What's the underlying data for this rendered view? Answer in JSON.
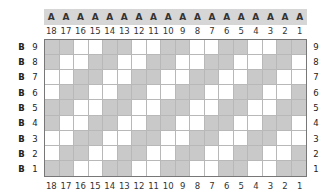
{
  "header": {
    "row_letter": "A",
    "letters": [
      "A",
      "A",
      "A",
      "A",
      "A",
      "A",
      "A",
      "A",
      "A",
      "A",
      "A",
      "A",
      "A",
      "A",
      "A",
      "A",
      "A",
      "A"
    ]
  },
  "columns": [
    "18",
    "17",
    "16",
    "15",
    "14",
    "13",
    "12",
    "11",
    "10",
    "9",
    "8",
    "7",
    "6",
    "5",
    "4",
    "3",
    "2",
    "1"
  ],
  "rows": [
    {
      "letter": "B",
      "number": "9"
    },
    {
      "letter": "B",
      "number": "8"
    },
    {
      "letter": "B",
      "number": "7"
    },
    {
      "letter": "B",
      "number": "6"
    },
    {
      "letter": "B",
      "number": "5"
    },
    {
      "letter": "B",
      "number": "4"
    },
    {
      "letter": "B",
      "number": "3"
    },
    {
      "letter": "B",
      "number": "2"
    },
    {
      "letter": "B",
      "number": "1"
    }
  ],
  "grid": {
    "shaded_color": "#c9c9c9",
    "unshaded_color": "#ffffff",
    "pattern": [
      [
        1,
        1,
        0,
        0,
        1,
        1,
        0,
        0,
        1,
        1,
        0,
        0,
        1,
        1,
        0,
        0,
        1,
        1
      ],
      [
        1,
        0,
        0,
        1,
        1,
        0,
        0,
        1,
        1,
        0,
        0,
        1,
        1,
        0,
        0,
        1,
        1,
        0
      ],
      [
        0,
        0,
        1,
        1,
        0,
        0,
        1,
        1,
        0,
        0,
        1,
        1,
        0,
        0,
        1,
        1,
        0,
        0
      ],
      [
        0,
        1,
        1,
        0,
        0,
        1,
        1,
        0,
        0,
        1,
        1,
        0,
        0,
        1,
        1,
        0,
        0,
        1
      ],
      [
        1,
        1,
        0,
        0,
        1,
        1,
        0,
        0,
        1,
        1,
        0,
        0,
        1,
        1,
        0,
        0,
        1,
        1
      ],
      [
        1,
        0,
        0,
        1,
        1,
        0,
        0,
        1,
        1,
        0,
        0,
        1,
        1,
        0,
        0,
        1,
        1,
        0
      ],
      [
        0,
        0,
        1,
        1,
        0,
        0,
        1,
        1,
        0,
        0,
        1,
        1,
        0,
        0,
        1,
        1,
        0,
        0
      ],
      [
        0,
        1,
        1,
        0,
        0,
        1,
        1,
        0,
        0,
        1,
        1,
        0,
        0,
        1,
        1,
        0,
        0,
        1
      ],
      [
        1,
        1,
        0,
        0,
        1,
        1,
        0,
        0,
        1,
        1,
        0,
        0,
        1,
        1,
        0,
        0,
        1,
        1
      ]
    ]
  }
}
